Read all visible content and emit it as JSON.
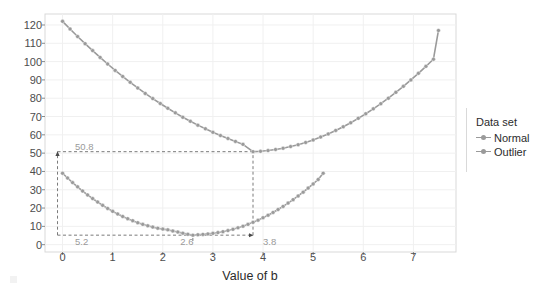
{
  "chart_data": {
    "type": "line",
    "title": "",
    "xlabel": "Value of b",
    "ylabel": "Sum of squared error",
    "xlim": [
      -0.35,
      7.85
    ],
    "ylim": [
      -4,
      126
    ],
    "xticks": [
      0,
      1,
      2,
      3,
      4,
      5,
      6,
      7
    ],
    "yticks": [
      0,
      10,
      20,
      30,
      40,
      50,
      60,
      70,
      80,
      90,
      100,
      110,
      120
    ],
    "grid": true,
    "legend_position": "right",
    "legend_title": "Data set",
    "marker": "circle",
    "series": [
      {
        "name": "Normal",
        "color": "#9a9a9a",
        "x": [
          0,
          0.1,
          0.2,
          0.3,
          0.4,
          0.5,
          0.6,
          0.7,
          0.8,
          0.9,
          1,
          1.1,
          1.2,
          1.3,
          1.4,
          1.5,
          1.6,
          1.7,
          1.8,
          1.9,
          2,
          2.1,
          2.2,
          2.3,
          2.4,
          2.5,
          2.6,
          2.7,
          2.8,
          2.9,
          3,
          3.1,
          3.2,
          3.3,
          3.4,
          3.5,
          3.6,
          3.7,
          3.8,
          3.9,
          4,
          4.1,
          4.2,
          4.3,
          4.4,
          4.5,
          4.6,
          4.7,
          4.8,
          4.9,
          5,
          5.1,
          5.2
        ],
        "y": [
          39.0,
          36.4,
          33.9,
          31.6,
          29.3,
          27.2,
          25.2,
          23.3,
          21.5,
          19.8,
          18.2,
          16.8,
          15.4,
          14.2,
          13.1,
          12.0,
          11.1,
          10.3,
          9.6,
          9.0,
          8.5,
          8.1,
          7.5,
          6.9,
          6.3,
          5.7,
          5.2,
          5.4,
          5.6,
          5.9,
          6.2,
          6.6,
          7.1,
          7.7,
          8.4,
          9.2,
          10.1,
          11.1,
          12.2,
          13.4,
          14.7,
          16.1,
          17.6,
          19.2,
          20.9,
          22.7,
          24.6,
          26.6,
          28.7,
          30.9,
          33.2,
          35.6,
          39.0
        ]
      },
      {
        "name": "Outlier",
        "color": "#9a9a9a",
        "x": [
          0,
          0.15,
          0.3,
          0.45,
          0.6,
          0.75,
          0.9,
          1.05,
          1.2,
          1.35,
          1.5,
          1.65,
          1.8,
          1.95,
          2.1,
          2.25,
          2.4,
          2.55,
          2.7,
          2.85,
          3,
          3.15,
          3.3,
          3.45,
          3.6,
          3.8,
          3.95,
          4.1,
          4.25,
          4.4,
          4.55,
          4.7,
          4.85,
          5,
          5.15,
          5.3,
          5.45,
          5.6,
          5.75,
          5.9,
          6.05,
          6.2,
          6.35,
          6.5,
          6.65,
          6.8,
          6.95,
          7.1,
          7.25,
          7.4,
          7.5
        ],
        "y": [
          122.0,
          117.8,
          113.7,
          109.8,
          106.0,
          102.3,
          98.7,
          95.2,
          91.9,
          88.7,
          85.6,
          82.6,
          79.8,
          77.1,
          74.5,
          72.0,
          69.6,
          67.4,
          65.3,
          63.3,
          61.4,
          59.6,
          58.0,
          56.4,
          54.8,
          50.8,
          51.0,
          51.4,
          52.0,
          52.7,
          53.6,
          54.6,
          55.8,
          57.2,
          58.8,
          60.5,
          62.4,
          64.4,
          66.6,
          69.0,
          71.5,
          74.2,
          77.0,
          80.0,
          83.2,
          86.5,
          90.0,
          93.6,
          97.4,
          101.3,
          117.0
        ]
      }
    ],
    "annotations": [
      {
        "label": "50.8",
        "x": 0.25,
        "y": 53.5,
        "kind": "y-value-outlier-min"
      },
      {
        "label": "5.2",
        "x": 0.25,
        "y": 1.5,
        "kind": "y-value-normal-min"
      },
      {
        "label": "2.6",
        "x": 2.35,
        "y": 1.5,
        "kind": "x-value-normal-min"
      },
      {
        "label": "3.8",
        "x": 4.0,
        "y": 1.5,
        "kind": "x-value-outlier-min"
      }
    ],
    "guide_lines": [
      {
        "kind": "horizontal-dashed",
        "y": 50.8,
        "from_x": -0.1,
        "to_x": 3.8
      },
      {
        "kind": "horizontal-dashed",
        "y": 5.2,
        "from_x": -0.1,
        "to_x": 2.6
      },
      {
        "kind": "vertical-dashed",
        "x": 3.8,
        "from_y": 5.2,
        "to_y": 50.8
      },
      {
        "kind": "vertical-dashed",
        "x": 2.6,
        "from_y": 2.0,
        "to_y": 5.2
      },
      {
        "kind": "vertical-dashed-arrow",
        "x": -0.1,
        "from_y": 5.2,
        "to_y": 50.8
      },
      {
        "kind": "horizontal-dashed-arrow",
        "y": 5.2,
        "from_x": 2.6,
        "to_x": 3.8
      }
    ]
  },
  "legend": {
    "title": "Data set",
    "entries": [
      {
        "label": "Normal",
        "color": "#9a9a9a"
      },
      {
        "label": "Outlier",
        "color": "#9a9a9a"
      }
    ]
  },
  "axes": {
    "xlabel": "Value of b",
    "ylabel": "Sum of squared error"
  },
  "colors": {
    "series": "#9a9a9a",
    "grid": "#f0f0f0",
    "panel_border": "#d9d9d9",
    "annotation_text": "#9a9a9a",
    "guide": "#7a7a7a",
    "tick_text": "#4d4d4d",
    "axis_title": "#2b2b2b"
  }
}
